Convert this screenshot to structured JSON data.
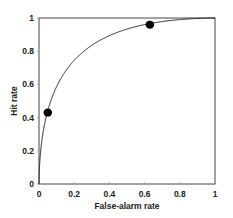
{
  "chart_data": {
    "type": "line",
    "title": "",
    "xlabel": "False-alarm rate",
    "ylabel": "Hit rate",
    "xlim": [
      0,
      1
    ],
    "ylim": [
      0,
      1
    ],
    "x_ticks": [
      "0",
      "0.2",
      "0.4",
      "0.6",
      "0.8",
      "1"
    ],
    "y_ticks": [
      "0",
      "0.2",
      "0.4",
      "0.6",
      "0.8",
      "1"
    ],
    "grid": false,
    "legend": null,
    "series": [
      {
        "name": "ROC curve",
        "kind": "line",
        "model": "equal-variance SDT, d' ≈ 1.5",
        "x": [
          0,
          0.005,
          0.01,
          0.02,
          0.05,
          0.1,
          0.15,
          0.2,
          0.3,
          0.4,
          0.5,
          0.6,
          0.7,
          0.8,
          0.9,
          0.95,
          1
        ],
        "y": [
          0,
          0.08,
          0.14,
          0.23,
          0.43,
          0.58,
          0.67,
          0.73,
          0.82,
          0.88,
          0.93,
          0.96,
          0.977,
          0.99,
          0.997,
          0.999,
          1
        ]
      },
      {
        "name": "Observed points",
        "kind": "scatter",
        "x": [
          0.05,
          0.63
        ],
        "y": [
          0.43,
          0.96
        ]
      }
    ],
    "colors": {
      "line": "#222222",
      "marker": "#000000",
      "frame": "#444444"
    }
  },
  "labels": {
    "xlabel": "False-alarm rate",
    "ylabel": "Hit rate"
  }
}
